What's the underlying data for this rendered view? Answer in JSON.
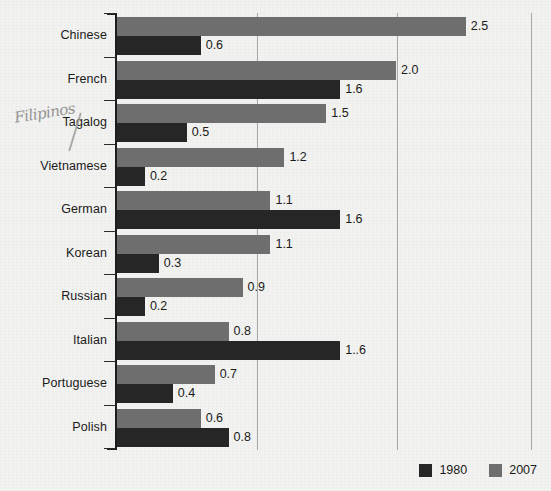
{
  "chart_data": {
    "type": "bar",
    "orientation": "horizontal",
    "title": "",
    "xlabel": "",
    "ylabel": "",
    "xlim": [
      0,
      3.1
    ],
    "grid": true,
    "gridlines": [
      1.0,
      2.0,
      3.0
    ],
    "legend_position": "bottom-right",
    "categories": [
      "Chinese",
      "French",
      "Tagalog",
      "Vietnamese",
      "German",
      "Korean",
      "Russian",
      "Italian",
      "Portuguese",
      "Polish"
    ],
    "series": [
      {
        "name": "2007",
        "color": "#6f6f6f",
        "values": [
          2.5,
          2.0,
          1.5,
          1.2,
          1.1,
          1.1,
          0.9,
          0.8,
          0.7,
          0.6
        ],
        "labels": [
          "2.5",
          "2.0",
          "1.5",
          "1.2",
          "1.1",
          "1.1",
          "0.9",
          "0.8",
          "0.7",
          "0.6"
        ]
      },
      {
        "name": "1980",
        "color": "#262626",
        "values": [
          0.6,
          1.6,
          0.5,
          0.2,
          1.6,
          0.3,
          0.2,
          1.6,
          0.4,
          0.8
        ],
        "labels": [
          "0.6",
          "1.6",
          "0.5",
          "0.2",
          "1.6",
          "0.3",
          "0.2",
          "1..6",
          "0.4",
          "0.8"
        ]
      }
    ]
  },
  "legend": {
    "items": [
      {
        "label": "1980",
        "series": "y1980"
      },
      {
        "label": "2007",
        "series": "y2007"
      }
    ]
  },
  "annotation": {
    "handwritten_note": "Filipinos",
    "attached_to": "Tagalog"
  },
  "background": {
    "ghost_text": ""
  },
  "colors": {
    "bar_1980": "#262626",
    "bar_2007": "#6f6f6f",
    "axis": "#1d1d1d",
    "gridline": "#a9a9a9",
    "page": "#f2f2f0",
    "text": "#1a1a1a",
    "handwriting": "#8d8d8d"
  }
}
